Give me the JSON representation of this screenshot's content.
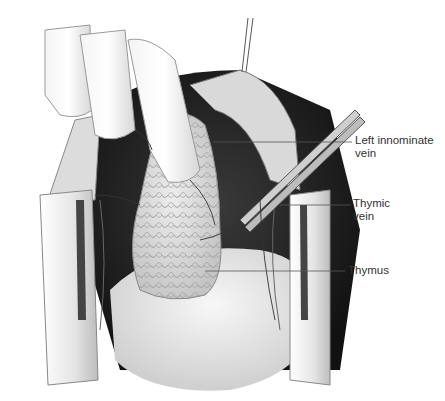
{
  "figure": {
    "colors": {
      "background": "#ffffff",
      "label_text": "#333333",
      "leader_line": "#555555",
      "tissue_dark": "#1e1e1e",
      "tissue_light": "#e8e8e8"
    }
  },
  "labels": [
    {
      "id": "left-innominate-vein",
      "line1": "Left innominate",
      "line2": "vein"
    },
    {
      "id": "thymic-vein",
      "line1": "Thymic",
      "line2": "vein"
    },
    {
      "id": "thymus",
      "line1": "Thymus",
      "line2": ""
    }
  ]
}
